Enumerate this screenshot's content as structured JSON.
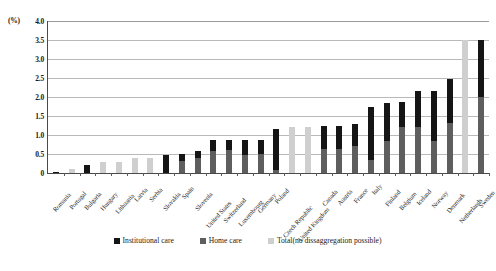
{
  "axis": {
    "unit_label": "(%)",
    "y_ticks": [
      "4.0",
      "3.5",
      "3.0",
      "2.5",
      "2.0",
      "1.5",
      "1.0",
      "0.5",
      "0"
    ]
  },
  "legend": {
    "items": [
      {
        "label": "Institutional care",
        "color": "#151515",
        "key": "institutional"
      },
      {
        "label": "Home care",
        "color": "#5e5e5e",
        "key": "home"
      },
      {
        "label": "Total(no dissaggregation possible)",
        "color": "#cfcfcf",
        "key": "total"
      }
    ]
  },
  "chart_data": {
    "type": "bar",
    "title": "",
    "subtitle": "",
    "xlabel": "",
    "ylabel": "(%)",
    "ylim": [
      0,
      4.0
    ],
    "ytick_step": 0.5,
    "grid": true,
    "legend_position": "bottom",
    "stacked": true,
    "categories": [
      "Romania",
      "Portugal",
      "Bulgaria",
      "Hungary",
      "Lithuania",
      "Latvia",
      "Serbia",
      "Slovakia",
      "Spain",
      "Slovenia",
      "United States",
      "Switzerland",
      "Luxembourg",
      "Germany",
      "Poland",
      "Czech Republic",
      "United Kingdom",
      "Canada",
      "Austria",
      "France",
      "Italy",
      "Finland",
      "Belgium",
      "Iceland",
      "Norway",
      "Denmark",
      "Netherlands",
      "Sweden"
    ],
    "series": [
      {
        "name": "Home care",
        "color": "#5e5e5e",
        "values": [
          0,
          0,
          0,
          0,
          0,
          0,
          0,
          0,
          0.32,
          0.4,
          0.58,
          0.6,
          0.47,
          0.5,
          0.08,
          0,
          0,
          0.62,
          0.63,
          0.72,
          0.35,
          0.85,
          1.22,
          1.2,
          0.85,
          1.32,
          0,
          2.0
        ]
      },
      {
        "name": "Institutional care",
        "color": "#151515",
        "values": [
          0.02,
          0,
          0.2,
          0,
          0,
          0,
          0,
          0.48,
          0.17,
          0.18,
          0.3,
          0.28,
          0.41,
          0.38,
          1.07,
          0,
          0,
          0.63,
          0.62,
          0.58,
          1.38,
          1.0,
          0.66,
          0.95,
          1.3,
          1.15,
          0,
          1.5
        ]
      },
      {
        "name": "Total(no dissaggregation possible)",
        "color": "#cfcfcf",
        "values": [
          0,
          0.1,
          0,
          0.3,
          0.3,
          0.4,
          0.4,
          0,
          0,
          0,
          0,
          0,
          0,
          0,
          0,
          1.2,
          1.2,
          0,
          0,
          0,
          0,
          0,
          0,
          0,
          0,
          0,
          3.5,
          0
        ]
      }
    ],
    "totals": [
      0.02,
      0.1,
      0.2,
      0.3,
      0.3,
      0.4,
      0.4,
      0.48,
      0.49,
      0.58,
      0.88,
      0.88,
      0.88,
      0.88,
      1.15,
      1.2,
      1.2,
      1.25,
      1.25,
      1.3,
      1.73,
      1.85,
      1.88,
      2.15,
      2.15,
      2.47,
      3.5,
      3.5
    ]
  }
}
